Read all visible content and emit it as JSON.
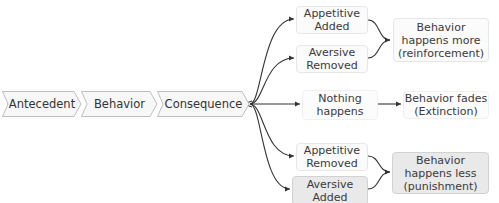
{
  "chain": {
    "antecedent": "Antecedent",
    "behavior": "Behavior",
    "consequence": "Consequence"
  },
  "outcomes": {
    "appetitive_added": "Appetitive\nAdded",
    "aversive_removed": "Aversive\nRemoved",
    "reinforcement": "Behavior\nhappens more\n(reinforcement)",
    "nothing_happens": "Nothing\nhappens",
    "extinction": "Behavior fades\n(Extinction)",
    "appetitive_removed": "Appetitive\nRemoved",
    "aversive_added": "Aversive\nAdded",
    "punishment": "Behavior\nhappens less\n(punishment)"
  },
  "colors": {
    "line": "#333333",
    "box_fill": "#fbfbfb",
    "box_fill_dark": "#e9e9e9",
    "box_border": "#e6e6e6"
  }
}
